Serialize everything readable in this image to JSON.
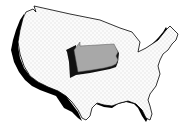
{
  "map": {
    "subject": "Contiguous United States outline",
    "highlighted_state": "Pennsylvania",
    "colors": {
      "background": "#ffffff",
      "us_fill": "#fafafa",
      "us_outline": "#000000",
      "shadow": "#000000",
      "highlight_fill": "#a8a8a8",
      "highlight_side": "#111111"
    }
  }
}
